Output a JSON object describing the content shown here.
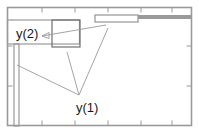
{
  "diagram": {
    "type": "technical-line-drawing",
    "background_color": "#ffffff",
    "frame": {
      "name": "outer-frame",
      "x": 7.5,
      "y": 7.5,
      "width": 184,
      "height": 118,
      "stroke": "#9a9a9a",
      "stroke_width": 1.6
    },
    "ticks": {
      "stroke": "#9a9a9a",
      "stroke_width": 1,
      "length": 5,
      "top_x": [
        42,
        75,
        108,
        141,
        172
      ],
      "bottom_x": [
        42,
        75,
        108,
        141,
        172
      ],
      "left_y": [
        46,
        86
      ],
      "right_y": [
        46,
        86
      ]
    },
    "members": [
      {
        "name": "left-vertical-member",
        "shape": "rect",
        "x": 14,
        "y": 44,
        "width": 5,
        "height": 82,
        "stroke": "#9a9a9a",
        "stroke_width": 1.2,
        "fill": "none"
      },
      {
        "name": "top-left-horizontal-member",
        "shape": "rect",
        "x": 7.5,
        "y": 20,
        "width": 72,
        "height": 24,
        "stroke": "#9a9a9a",
        "stroke_width": 1.2,
        "fill": "none"
      },
      {
        "name": "small-rectangle-member",
        "shape": "rect",
        "x": 52,
        "y": 20,
        "width": 28,
        "height": 27,
        "stroke": "#707070",
        "stroke_width": 1.2,
        "fill": "none"
      },
      {
        "name": "thin-horizontal-bar",
        "shape": "rect",
        "x": 95,
        "y": 15,
        "width": 43,
        "height": 7,
        "stroke": "#8a8a8a",
        "stroke_width": 1.1,
        "fill": "none"
      },
      {
        "name": "thick-horizontal-bar",
        "shape": "rect",
        "x": 138,
        "y": 15,
        "width": 54,
        "height": 4,
        "stroke": "none",
        "fill": "#9a9a9a"
      }
    ],
    "leader_lines": {
      "stroke": "#9a9a9a",
      "stroke_width": 0.9,
      "lines": [
        {
          "name": "leader-y1-from-left-member",
          "x1": 17,
          "y1": 65,
          "x2": 79,
          "y2": 95
        },
        {
          "name": "leader-y1-from-upper-mid",
          "x1": 67,
          "y1": 52,
          "x2": 79,
          "y2": 95
        },
        {
          "name": "leader-y1-from-upper-right",
          "x1": 108,
          "y1": 28,
          "x2": 79,
          "y2": 95
        },
        {
          "name": "leader-y2-to-bar",
          "x1": 42,
          "y1": 36,
          "x2": 106,
          "y2": 25
        }
      ],
      "arrow_tip": {
        "name": "leader-y2-arrow-tip",
        "x": 42,
        "y": 36
      }
    },
    "labels": [
      {
        "name": "label-y2",
        "text": "y(2)",
        "x": 16,
        "y": 38,
        "font_size": 13,
        "color": "#1a1a1a"
      },
      {
        "name": "label-y1",
        "text": "y(1)",
        "x": 76,
        "y": 112,
        "font_size": 13,
        "color": "#1a1a1a"
      }
    ]
  }
}
